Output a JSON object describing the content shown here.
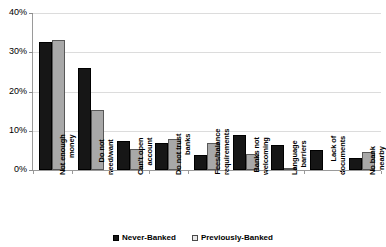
{
  "chart_data": {
    "type": "bar",
    "title": "",
    "subtitle": "",
    "xlabel": "",
    "ylabel": "",
    "ylim": [
      0,
      40
    ],
    "ytick_labels": [
      "0%",
      "10%",
      "20%",
      "30%",
      "40%"
    ],
    "ytick_values": [
      0,
      10,
      20,
      30,
      40
    ],
    "grid": true,
    "legend_position": "bottom",
    "categories": [
      "Not enough money",
      "Do not need/want",
      "Can't open account",
      "Do not trust banks",
      "Fees/balance requirements",
      "Banks not welcoming",
      "Language barriers",
      "Lack of documents",
      "No bank nearby"
    ],
    "category_lines": [
      [
        "Not enough",
        "money"
      ],
      [
        "Do not",
        "need/want"
      ],
      [
        "Can't open",
        "account"
      ],
      [
        "Do not trust",
        "banks"
      ],
      [
        "Fees/balance",
        "requirements"
      ],
      [
        "Banks not",
        "welcoming"
      ],
      [
        "Language",
        "barriers"
      ],
      [
        "Lack of",
        "documents"
      ],
      [
        "No bank",
        "nearby"
      ]
    ],
    "series": [
      {
        "name": "Never-Banked",
        "color": "#161616",
        "values": [
          32.5,
          25.9,
          7.5,
          6.8,
          3.7,
          8.9,
          6.5,
          5.0,
          3.0
        ]
      },
      {
        "name": "Previously-Banked",
        "color": "#a8a8a8",
        "values": [
          33.2,
          15.4,
          5.4,
          7.8,
          6.8,
          4.2,
          0.2,
          0.0,
          4.5
        ]
      }
    ]
  },
  "legend": {
    "items": [
      {
        "label": "Never-Banked",
        "swatch": "filled-black-square"
      },
      {
        "label": "Previously-Banked",
        "swatch": "outlined-light-square"
      }
    ]
  },
  "colors": {
    "never_banked": "#161616",
    "previously_banked": "#a8a8a8",
    "gridline": "#dcdcdc",
    "axis": "#9a9a9a",
    "background": "#ffffff"
  }
}
